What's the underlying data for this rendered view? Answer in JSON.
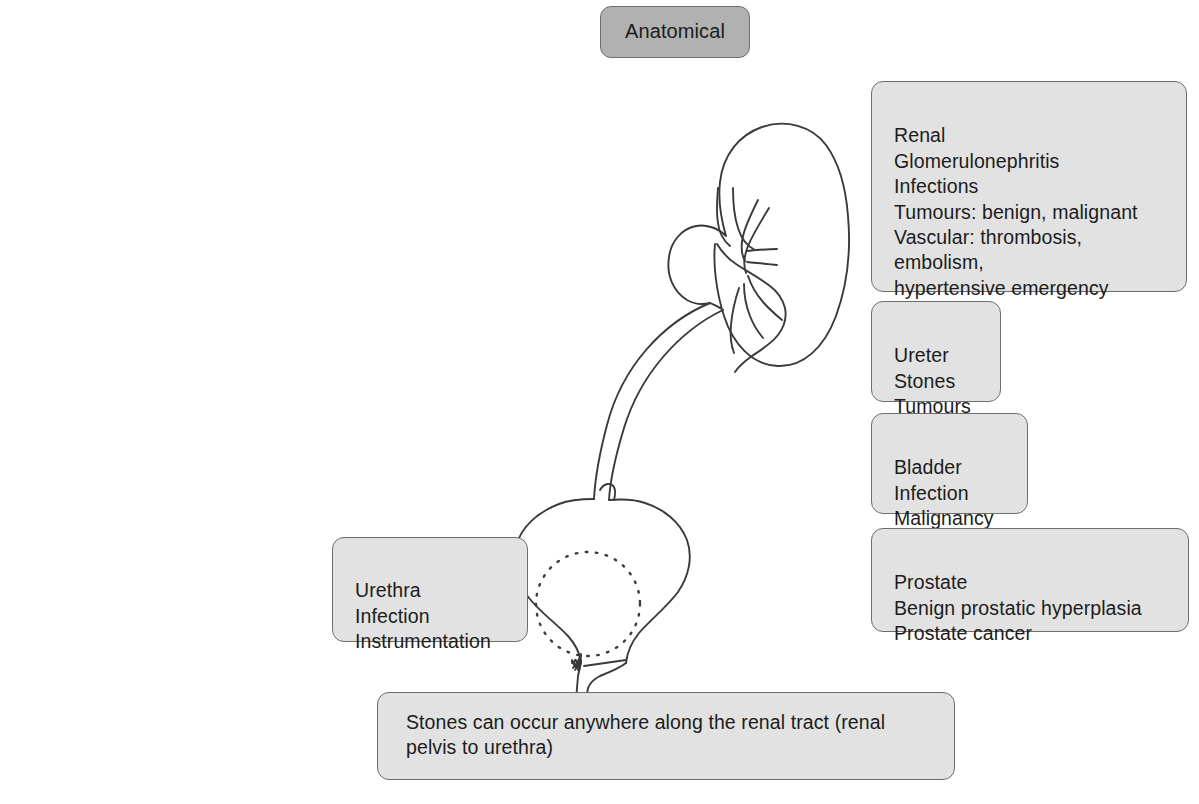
{
  "figure": {
    "title": "Anatomical",
    "caption": "Stones can occur anywhere along the renal tract (renal pelvis to urethra)"
  },
  "boxes": {
    "renal": {
      "heading": "Renal",
      "text": "Renal\nGlomerulonephritis\nInfections\nTumours: benign, malignant\nVascular: thrombosis,\nembolism,\nhypertensive emergency",
      "items": [
        "Glomerulonephritis",
        "Infections",
        "Tumours: benign, malignant",
        "Vascular: thrombosis,",
        "embolism,",
        "hypertensive emergency"
      ]
    },
    "ureter": {
      "heading": "Ureter",
      "text": "Ureter\nStones\nTumours",
      "items": [
        "Stones",
        "Tumours"
      ]
    },
    "bladder": {
      "heading": "Bladder",
      "text": "Bladder\nInfection\nMalignancy",
      "items": [
        "Infection",
        "Malignancy"
      ]
    },
    "prostate": {
      "heading": "Prostate",
      "text": "Prostate\nBenign prostatic hyperplasia\nProstate cancer",
      "items": [
        "Benign prostatic hyperplasia",
        "Prostate cancer"
      ]
    },
    "urethra": {
      "heading": "Urethra",
      "text": "Urethra\nInfection\nInstrumentation",
      "items": [
        "Infection",
        "Instrumentation"
      ]
    }
  },
  "anatomy": {
    "parts": [
      "kidney-outline",
      "renal-pelvis-calyces",
      "ureter-tube",
      "bladder-outline",
      "bladder-interior-mark",
      "prostate-dotted-circle",
      "urethra-tube"
    ]
  },
  "colors": {
    "box_fill": "#e2e2e2",
    "box_border": "#6e6e6e",
    "title_fill": "#b1b1b1",
    "text": "#1c1c1c",
    "anatomy_line": "#3a3a3a",
    "page_background": "#ffffff"
  }
}
